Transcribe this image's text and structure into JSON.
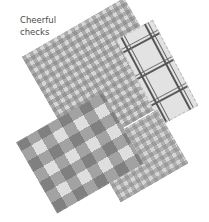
{
  "caption": {
    "line1": "Cheerful",
    "line2": "checks"
  },
  "swatches": [
    {
      "name": "small gingham",
      "position": "back-center"
    },
    {
      "name": "windowpane plaid",
      "position": "right"
    },
    {
      "name": "small gingham",
      "position": "bottom-right"
    },
    {
      "name": "large gingham",
      "position": "bottom-left"
    }
  ],
  "colors": {
    "background": "#ffffff",
    "caption_text": "#4a4a4a",
    "fabric_light": "#dedede",
    "fabric_dark": "#555555"
  }
}
